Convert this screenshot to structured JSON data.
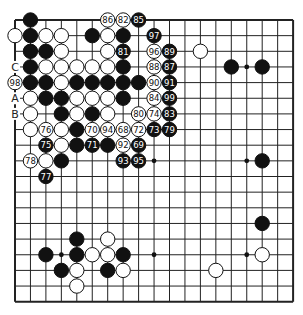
{
  "board": {
    "size": 19,
    "origin_x": 15,
    "origin_y": 20,
    "spacing_x": 15.45,
    "spacing_y": 15.65,
    "stone_radius": 7.2,
    "colors": {
      "black": "#111111",
      "white": "#ffffff",
      "line": "#222222",
      "background": "#ffffff"
    },
    "star_points": [
      [
        3,
        3
      ],
      [
        9,
        3
      ],
      [
        15,
        3
      ],
      [
        3,
        9
      ],
      [
        9,
        9
      ],
      [
        15,
        9
      ],
      [
        3,
        15
      ],
      [
        9,
        15
      ],
      [
        15,
        15
      ]
    ],
    "stones": [
      {
        "c": 1,
        "r": 0,
        "color": "black",
        "label": ""
      },
      {
        "c": 6,
        "r": 0,
        "color": "white",
        "label": "86"
      },
      {
        "c": 7,
        "r": 0,
        "color": "white",
        "label": "82"
      },
      {
        "c": 8,
        "r": 0,
        "color": "black",
        "label": "85"
      },
      {
        "c": 0,
        "r": 1,
        "color": "white",
        "label": ""
      },
      {
        "c": 1,
        "r": 1,
        "color": "black",
        "label": ""
      },
      {
        "c": 2,
        "r": 1,
        "color": "white",
        "label": ""
      },
      {
        "c": 3,
        "r": 1,
        "color": "white",
        "label": ""
      },
      {
        "c": 5,
        "r": 1,
        "color": "black",
        "label": ""
      },
      {
        "c": 6,
        "r": 1,
        "color": "white",
        "label": ""
      },
      {
        "c": 7,
        "r": 1,
        "color": "black",
        "label": ""
      },
      {
        "c": 9,
        "r": 1,
        "color": "black",
        "label": "97"
      },
      {
        "c": 1,
        "r": 2,
        "color": "black",
        "label": ""
      },
      {
        "c": 2,
        "r": 2,
        "color": "black",
        "label": ""
      },
      {
        "c": 3,
        "r": 2,
        "color": "white",
        "label": ""
      },
      {
        "c": 6,
        "r": 2,
        "color": "white",
        "label": ""
      },
      {
        "c": 7,
        "r": 2,
        "color": "black",
        "label": "81"
      },
      {
        "c": 9,
        "r": 2,
        "color": "white",
        "label": "96"
      },
      {
        "c": 10,
        "r": 2,
        "color": "black",
        "label": "89"
      },
      {
        "c": 12,
        "r": 2,
        "color": "white",
        "label": ""
      },
      {
        "c": 1,
        "r": 3,
        "color": "black",
        "label": ""
      },
      {
        "c": 2,
        "r": 3,
        "color": "white",
        "label": ""
      },
      {
        "c": 3,
        "r": 3,
        "color": "white",
        "label": ""
      },
      {
        "c": 4,
        "r": 3,
        "color": "white",
        "label": ""
      },
      {
        "c": 5,
        "r": 3,
        "color": "white",
        "label": ""
      },
      {
        "c": 6,
        "r": 3,
        "color": "white",
        "label": ""
      },
      {
        "c": 7,
        "r": 3,
        "color": "black",
        "label": ""
      },
      {
        "c": 9,
        "r": 3,
        "color": "white",
        "label": "88"
      },
      {
        "c": 10,
        "r": 3,
        "color": "black",
        "label": "87"
      },
      {
        "c": 14,
        "r": 3,
        "color": "black",
        "label": ""
      },
      {
        "c": 16,
        "r": 3,
        "color": "black",
        "label": ""
      },
      {
        "c": 0,
        "r": 4,
        "color": "white",
        "label": "98"
      },
      {
        "c": 1,
        "r": 4,
        "color": "black",
        "label": ""
      },
      {
        "c": 2,
        "r": 4,
        "color": "black",
        "label": ""
      },
      {
        "c": 3,
        "r": 4,
        "color": "white",
        "label": ""
      },
      {
        "c": 4,
        "r": 4,
        "color": "black",
        "label": ""
      },
      {
        "c": 5,
        "r": 4,
        "color": "black",
        "label": ""
      },
      {
        "c": 6,
        "r": 4,
        "color": "black",
        "label": ""
      },
      {
        "c": 7,
        "r": 4,
        "color": "black",
        "label": ""
      },
      {
        "c": 8,
        "r": 4,
        "color": "black",
        "label": ""
      },
      {
        "c": 9,
        "r": 4,
        "color": "white",
        "label": "90"
      },
      {
        "c": 10,
        "r": 4,
        "color": "black",
        "label": "91"
      },
      {
        "c": 1,
        "r": 5,
        "color": "white",
        "label": ""
      },
      {
        "c": 2,
        "r": 5,
        "color": "black",
        "label": ""
      },
      {
        "c": 3,
        "r": 5,
        "color": "black",
        "label": ""
      },
      {
        "c": 4,
        "r": 5,
        "color": "white",
        "label": ""
      },
      {
        "c": 5,
        "r": 5,
        "color": "white",
        "label": ""
      },
      {
        "c": 6,
        "r": 5,
        "color": "white",
        "label": ""
      },
      {
        "c": 7,
        "r": 5,
        "color": "black",
        "label": ""
      },
      {
        "c": 9,
        "r": 5,
        "color": "white",
        "label": "84"
      },
      {
        "c": 10,
        "r": 5,
        "color": "black",
        "label": "99"
      },
      {
        "c": 1,
        "r": 6,
        "color": "white",
        "label": ""
      },
      {
        "c": 3,
        "r": 6,
        "color": "black",
        "label": ""
      },
      {
        "c": 4,
        "r": 6,
        "color": "white",
        "label": ""
      },
      {
        "c": 5,
        "r": 6,
        "color": "black",
        "label": ""
      },
      {
        "c": 6,
        "r": 6,
        "color": "white",
        "label": ""
      },
      {
        "c": 8,
        "r": 6,
        "color": "white",
        "label": "80"
      },
      {
        "c": 9,
        "r": 6,
        "color": "white",
        "label": "74"
      },
      {
        "c": 10,
        "r": 6,
        "color": "black",
        "label": "83"
      },
      {
        "c": 1,
        "r": 7,
        "color": "white",
        "label": ""
      },
      {
        "c": 2,
        "r": 7,
        "color": "white",
        "label": "76"
      },
      {
        "c": 3,
        "r": 7,
        "color": "white",
        "label": ""
      },
      {
        "c": 4,
        "r": 7,
        "color": "black",
        "label": ""
      },
      {
        "c": 5,
        "r": 7,
        "color": "white",
        "label": "70"
      },
      {
        "c": 6,
        "r": 7,
        "color": "white",
        "label": "94"
      },
      {
        "c": 7,
        "r": 7,
        "color": "white",
        "label": "68"
      },
      {
        "c": 8,
        "r": 7,
        "color": "white",
        "label": "72"
      },
      {
        "c": 9,
        "r": 7,
        "color": "black",
        "label": "73"
      },
      {
        "c": 10,
        "r": 7,
        "color": "black",
        "label": "79"
      },
      {
        "c": 2,
        "r": 8,
        "color": "black",
        "label": "75"
      },
      {
        "c": 3,
        "r": 8,
        "color": "white",
        "label": ""
      },
      {
        "c": 4,
        "r": 8,
        "color": "black",
        "label": ""
      },
      {
        "c": 5,
        "r": 8,
        "color": "black",
        "label": "71"
      },
      {
        "c": 6,
        "r": 8,
        "color": "black",
        "label": ""
      },
      {
        "c": 7,
        "r": 8,
        "color": "white",
        "label": "92"
      },
      {
        "c": 8,
        "r": 8,
        "color": "black",
        "label": "69"
      },
      {
        "c": 1,
        "r": 9,
        "color": "white",
        "label": "78"
      },
      {
        "c": 2,
        "r": 9,
        "color": "white",
        "label": ""
      },
      {
        "c": 3,
        "r": 9,
        "color": "black",
        "label": ""
      },
      {
        "c": 7,
        "r": 9,
        "color": "black",
        "label": "93"
      },
      {
        "c": 8,
        "r": 9,
        "color": "black",
        "label": "95"
      },
      {
        "c": 16,
        "r": 9,
        "color": "black",
        "label": ""
      },
      {
        "c": 2,
        "r": 10,
        "color": "black",
        "label": "77"
      },
      {
        "c": 16,
        "r": 13,
        "color": "black",
        "label": ""
      },
      {
        "c": 4,
        "r": 14,
        "color": "black",
        "label": ""
      },
      {
        "c": 6,
        "r": 14,
        "color": "white",
        "label": ""
      },
      {
        "c": 2,
        "r": 15,
        "color": "black",
        "label": ""
      },
      {
        "c": 4,
        "r": 15,
        "color": "black",
        "label": ""
      },
      {
        "c": 5,
        "r": 15,
        "color": "white",
        "label": ""
      },
      {
        "c": 6,
        "r": 15,
        "color": "white",
        "label": ""
      },
      {
        "c": 7,
        "r": 15,
        "color": "black",
        "label": ""
      },
      {
        "c": 16,
        "r": 15,
        "color": "white",
        "label": ""
      },
      {
        "c": 3,
        "r": 16,
        "color": "black",
        "label": ""
      },
      {
        "c": 4,
        "r": 16,
        "color": "white",
        "label": ""
      },
      {
        "c": 6,
        "r": 16,
        "color": "black",
        "label": ""
      },
      {
        "c": 7,
        "r": 16,
        "color": "white",
        "label": ""
      },
      {
        "c": 13,
        "r": 16,
        "color": "white",
        "label": ""
      },
      {
        "c": 4,
        "r": 17,
        "color": "white",
        "label": ""
      }
    ],
    "point_labels": [
      {
        "c": 0,
        "r": 3,
        "text": "C"
      },
      {
        "c": 0,
        "r": 5,
        "text": "A"
      },
      {
        "c": 0,
        "r": 6,
        "text": "B"
      }
    ]
  }
}
